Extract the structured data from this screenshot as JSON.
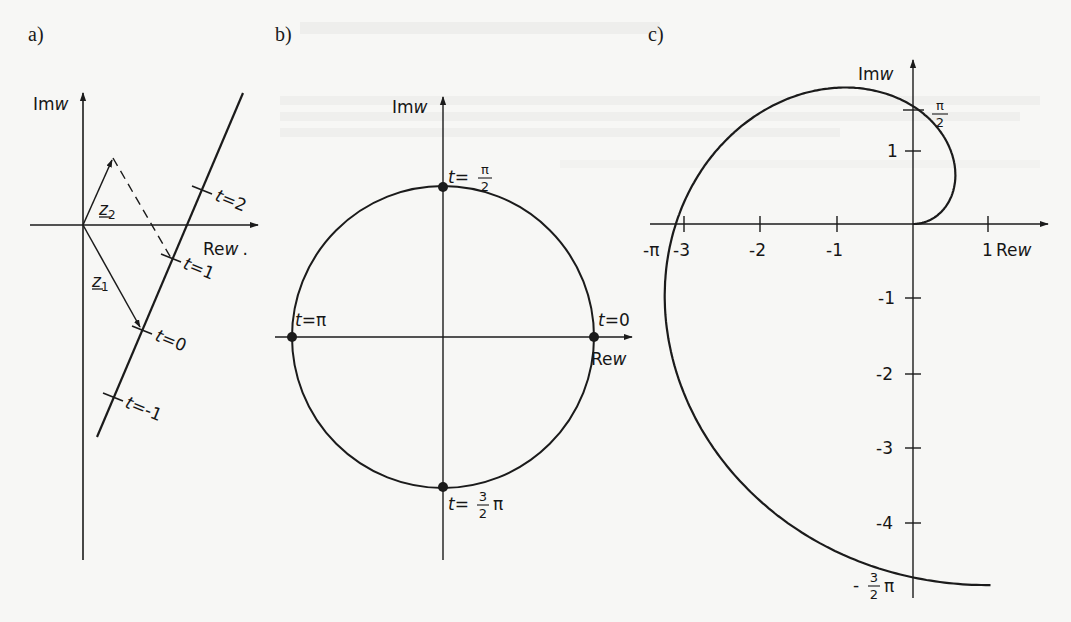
{
  "figure": {
    "panels": [
      {
        "id": "a",
        "label": "a)",
        "axes": {
          "imag_label": "Im",
          "imag_var": "w",
          "real_label": "Re",
          "real_var": "w",
          "real_suffix": "."
        },
        "vectors": [
          {
            "name": "z",
            "subscript": "2",
            "label_prefix": "z",
            "label_sub": "2"
          },
          {
            "name": "z",
            "subscript": "1",
            "label_prefix": "z",
            "label_sub": "1"
          }
        ],
        "line_points": [
          {
            "var": "t",
            "value": "2"
          },
          {
            "var": "t",
            "value": "1"
          },
          {
            "var": "t",
            "value": "0"
          },
          {
            "var": "t",
            "value": "-1"
          }
        ]
      },
      {
        "id": "b",
        "label": "b)",
        "axes": {
          "imag_label": "Im",
          "imag_var": "w",
          "real_label": "Re",
          "real_var": "w"
        },
        "circle_points": [
          {
            "var": "t",
            "value": "π",
            "num": "",
            "den": ""
          },
          {
            "var": "t",
            "value": "",
            "num": "π",
            "den": "2"
          },
          {
            "var": "t",
            "value": "0",
            "num": "",
            "den": ""
          },
          {
            "var": "t",
            "value": "π",
            "num": "3",
            "den": "2"
          }
        ]
      },
      {
        "id": "c",
        "label": "c)",
        "axes": {
          "imag_label": "Im",
          "imag_var": "w",
          "real_label": "Re",
          "real_var": "w"
        },
        "x_ticks": [
          "-π",
          "-3",
          "-2",
          "-1",
          "1"
        ],
        "y_ticks": [
          "1",
          "-1",
          "-2",
          "-3",
          "-4"
        ],
        "special_y_labels": [
          {
            "num": "π",
            "den": "2",
            "prefix": "",
            "suffix": ""
          },
          {
            "num": "3",
            "den": "2",
            "prefix": "-",
            "suffix": "π"
          }
        ]
      }
    ]
  },
  "chart_data": {
    "type": "line",
    "title": "",
    "panels": [
      {
        "panel": "a",
        "description": "Straight line w = z1 + t(z2 - z1) in the complex plane",
        "xlabel": "Re w",
        "ylabel": "Im w",
        "points": [
          {
            "t": -1,
            "label": "t=-1"
          },
          {
            "t": 0,
            "label": "t=0"
          },
          {
            "t": 1,
            "label": "t=1"
          },
          {
            "t": 2,
            "label": "t=2"
          }
        ],
        "vectors": [
          "z1",
          "z2"
        ]
      },
      {
        "panel": "b",
        "description": "Unit circle w = e^{it}",
        "xlabel": "Re w",
        "ylabel": "Im w",
        "points": [
          {
            "t": "0",
            "re": 1,
            "im": 0
          },
          {
            "t": "π/2",
            "re": 0,
            "im": 1
          },
          {
            "t": "π",
            "re": -1,
            "im": 0
          },
          {
            "t": "3π/2",
            "re": 0,
            "im": -1
          }
        ]
      },
      {
        "panel": "c",
        "description": "Spiral w = t·e^{it}",
        "xlabel": "Re w",
        "ylabel": "Im w",
        "x_ticks": [
          -3.1416,
          -3,
          -2,
          -1,
          1
        ],
        "y_ticks": [
          1,
          1.5708,
          -1,
          -2,
          -3,
          -4,
          -4.7124
        ],
        "xlim": [
          -3.3,
          1.8
        ],
        "ylim": [
          -5,
          1.9
        ],
        "points": [
          {
            "t": "0",
            "re": 0,
            "im": 0
          },
          {
            "t": "π/2",
            "re": 0,
            "im": 1.5708
          },
          {
            "t": "π",
            "re": -3.1416,
            "im": 0
          },
          {
            "t": "3π/2",
            "re": 0,
            "im": -4.7124
          }
        ],
        "grid": false
      }
    ]
  }
}
